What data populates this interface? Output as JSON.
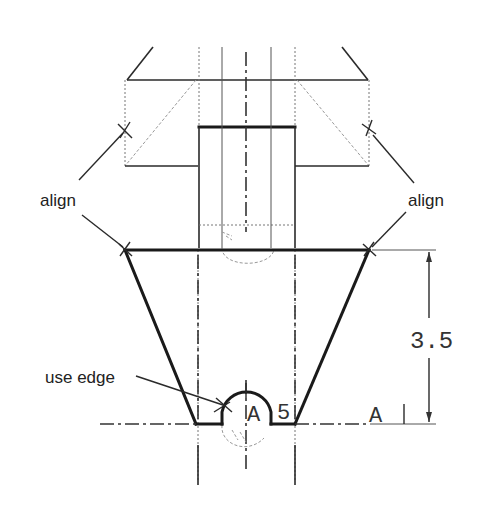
{
  "drawing": {
    "annotations": {
      "align_left": "align",
      "align_right": "align",
      "use_edge": "use edge"
    },
    "dimensions": {
      "height_value": "3.5",
      "radius_value": "5",
      "radius_prefix": "A",
      "datum_label": "A"
    },
    "colors": {
      "line": "#1a1a1a",
      "hidden": "#777777",
      "background": "#ffffff"
    }
  }
}
